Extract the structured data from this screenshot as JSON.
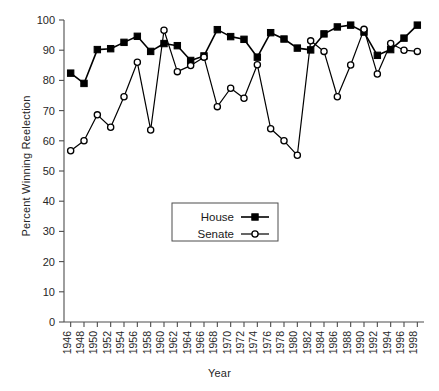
{
  "chart_data": {
    "type": "line",
    "title": "",
    "xlabel": "Year",
    "ylabel": "Percent Winning Reelection",
    "x": [
      1946,
      1948,
      1950,
      1952,
      1954,
      1956,
      1958,
      1960,
      1962,
      1964,
      1966,
      1968,
      1970,
      1972,
      1974,
      1976,
      1978,
      1980,
      1982,
      1984,
      1986,
      1988,
      1990,
      1992,
      1994,
      1996,
      1998
    ],
    "xlim": [
      1945,
      1999
    ],
    "ylim": [
      0,
      100
    ],
    "ytick_step": 10,
    "xtick_step": 2,
    "grid": false,
    "legend_position": "center",
    "series": [
      {
        "name": "House",
        "marker": "filled-square",
        "color": "#000000",
        "values": [
          82.4,
          79.0,
          90.2,
          90.5,
          92.6,
          94.6,
          89.6,
          92.2,
          91.5,
          86.6,
          88.1,
          96.8,
          94.5,
          93.6,
          87.7,
          95.8,
          93.7,
          90.7,
          90.1,
          95.4,
          97.7,
          98.3,
          96.0,
          88.3,
          90.2,
          94.0,
          98.3
        ]
      },
      {
        "name": "Senate",
        "marker": "open-circle",
        "color": "#000000",
        "values": [
          56.7,
          60.0,
          68.6,
          64.5,
          74.6,
          86.0,
          63.6,
          96.6,
          82.9,
          84.9,
          87.7,
          71.3,
          77.4,
          74.1,
          85.2,
          64.0,
          60.0,
          55.2,
          93.1,
          89.6,
          74.6,
          85.1,
          96.9,
          82.1,
          92.2,
          90.0,
          89.6
        ]
      }
    ]
  },
  "legend": {
    "entries": [
      {
        "label": "House",
        "marker": "filled-square"
      },
      {
        "label": "Senate",
        "marker": "open-circle"
      }
    ]
  },
  "axes": {
    "y_ticks": [
      "0",
      "10",
      "20",
      "30",
      "40",
      "50",
      "60",
      "70",
      "80",
      "90",
      "100"
    ],
    "x_ticks": [
      "1946",
      "1948",
      "1950",
      "1952",
      "1954",
      "1956",
      "1958",
      "1960",
      "1962",
      "1964",
      "1966",
      "1968",
      "1970",
      "1972",
      "1974",
      "1976",
      "1978",
      "1980",
      "1982",
      "1984",
      "1986",
      "1988",
      "1990",
      "1992",
      "1994",
      "1996",
      "1998"
    ]
  }
}
